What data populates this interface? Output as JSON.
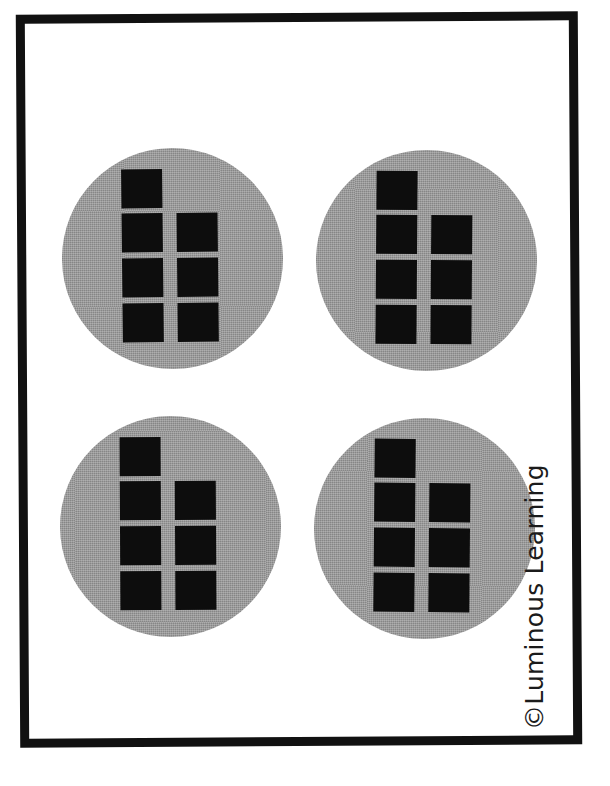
{
  "page": {
    "background_color": "#ffffff",
    "frame_color": "#111111",
    "width": 610,
    "height": 786
  },
  "copyright": {
    "text": "©Luminous Learning",
    "symbol": "©",
    "brand": "Luminous Learning",
    "orientation": "rotated-90-ccw",
    "color": "#1b1b1b"
  },
  "manipulatives": {
    "disc_color": "#9a9a9a",
    "counter_color": "#0d0d0d",
    "counters_per_group": 7,
    "group_count": 4,
    "total_counters": 28,
    "layout_note": "each gray circle holds 7 black squares: one square in the top row, then three rows of two",
    "groups": [
      {
        "id": "group-1",
        "position": "top-left",
        "counter_count": 7,
        "rows": [
          {
            "row": 1,
            "squares": [
              "left"
            ]
          },
          {
            "row": 2,
            "squares": [
              "left",
              "right"
            ]
          },
          {
            "row": 3,
            "squares": [
              "left",
              "right"
            ]
          },
          {
            "row": 4,
            "squares": [
              "left",
              "right"
            ]
          }
        ]
      },
      {
        "id": "group-2",
        "position": "top-right",
        "counter_count": 7,
        "rows": [
          {
            "row": 1,
            "squares": [
              "left"
            ]
          },
          {
            "row": 2,
            "squares": [
              "left",
              "right"
            ]
          },
          {
            "row": 3,
            "squares": [
              "left",
              "right"
            ]
          },
          {
            "row": 4,
            "squares": [
              "left",
              "right"
            ]
          }
        ]
      },
      {
        "id": "group-3",
        "position": "bottom-left",
        "counter_count": 7,
        "rows": [
          {
            "row": 1,
            "squares": [
              "left"
            ]
          },
          {
            "row": 2,
            "squares": [
              "left",
              "right"
            ]
          },
          {
            "row": 3,
            "squares": [
              "left",
              "right"
            ]
          },
          {
            "row": 4,
            "squares": [
              "left",
              "right"
            ]
          }
        ]
      },
      {
        "id": "group-4",
        "position": "bottom-right",
        "counter_count": 7,
        "rows": [
          {
            "row": 1,
            "squares": [
              "left"
            ]
          },
          {
            "row": 2,
            "squares": [
              "left",
              "right"
            ]
          },
          {
            "row": 3,
            "squares": [
              "left",
              "right"
            ]
          },
          {
            "row": 4,
            "squares": [
              "left",
              "right"
            ]
          }
        ]
      }
    ]
  }
}
